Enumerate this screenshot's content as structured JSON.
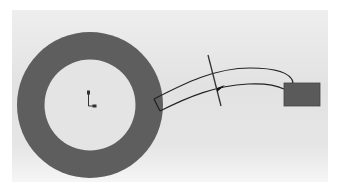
{
  "scene": {
    "type": "cad-sketch",
    "background": "#e4e4e4",
    "ring": {
      "cx": 90,
      "cy": 105,
      "outer_r": 73,
      "inner_r": 46,
      "fill": "#5e5e5e",
      "inner_fill": "#e6e6e6"
    },
    "origin_marker": {
      "x": 89,
      "y": 105
    },
    "sweep_path": {
      "stroke": "#222222"
    },
    "section_line": {
      "stroke": "#333333"
    },
    "block": {
      "x": 284,
      "y": 83,
      "width": 36,
      "height": 23,
      "fill": "#5a5a5a"
    }
  }
}
